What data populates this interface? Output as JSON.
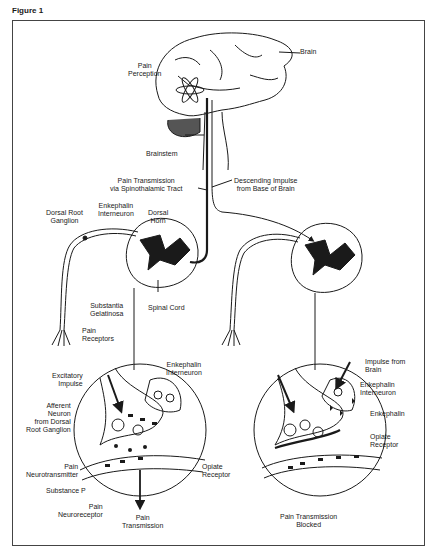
{
  "figure": {
    "title": "Figure 1"
  },
  "brain": {
    "pain_perception": "Pain\nPerception",
    "brain": "Brain",
    "brainstem": "Brainstem",
    "pain_transmission_tract": "Pain Transmission\nvia Spinothalamic Tract",
    "descending_impulse": "Descending Impulse\nfrom Base of Brain"
  },
  "left_cord": {
    "dorsal_root_ganglion": "Dorsal Root\nGanglion",
    "enkephalin_interneuron": "Enkephalin\nInterneuron",
    "dorsal_horn": "Dorsal\nHorn",
    "substantia_gelatinosa": "Substantia\nGelatinosa",
    "spinal_cord": "Spinal Cord",
    "pain_receptors": "Pain\nReceptors"
  },
  "left_synapse": {
    "excitatory_impulse": "Excitatory\nImpulse",
    "afferent_neuron": "Afferent\nNeuron\nfrom Dorsal\nRoot Ganglion",
    "enkephalin_interneuron": "Enkephalin\nInterneuron",
    "pain_neurotransmitter": "Pain\nNeurotransmitter",
    "substance_p": "Substance P",
    "pain_neuroreceptor": "Pain\nNeuroreceptor",
    "opiate_receptor": "Opiate\nReceptor",
    "pain_transmission": "Pain\nTransmission"
  },
  "right_synapse": {
    "impulse_from_brain": "Impulse from\nBrain",
    "enkephalin_interneuron": "Enkephalin\nInterneuron",
    "enkephalin": "Enkephalin",
    "opiate_receptor": "Opiate\nReceptor",
    "pain_transmission_blocked": "Pain Transmission\nBlocked"
  }
}
